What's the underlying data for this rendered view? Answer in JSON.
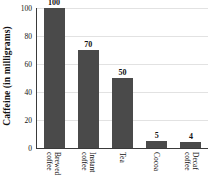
{
  "chart_data": {
    "type": "bar",
    "title": "",
    "xlabel": "",
    "ylabel": "Caffeine (in milligrams)",
    "categories": [
      "Brewed coffee",
      "Instant coffee",
      "Tea",
      "Cocoa",
      "Decaf coffee"
    ],
    "category_lines": [
      [
        "Brewed",
        "coffee"
      ],
      [
        "Instant",
        "coffee"
      ],
      [
        "Tea"
      ],
      [
        "Cocoa"
      ],
      [
        "Decaf",
        "coffee"
      ]
    ],
    "values": [
      100,
      70,
      50,
      5,
      4
    ],
    "value_labels": [
      "100",
      "70",
      "50",
      "5",
      "4"
    ],
    "ylim": [
      0,
      100
    ],
    "yticks": [
      0,
      20,
      40,
      60,
      80,
      100
    ],
    "ytick_labels": [
      "0",
      "20",
      "40",
      "60",
      "80",
      "100"
    ],
    "grid": true,
    "legend": false,
    "bar_color": "#4a4a4a",
    "axis_color": "#3a3a3a",
    "grid_color": "#e2e2e2",
    "background": "#ffffff"
  }
}
